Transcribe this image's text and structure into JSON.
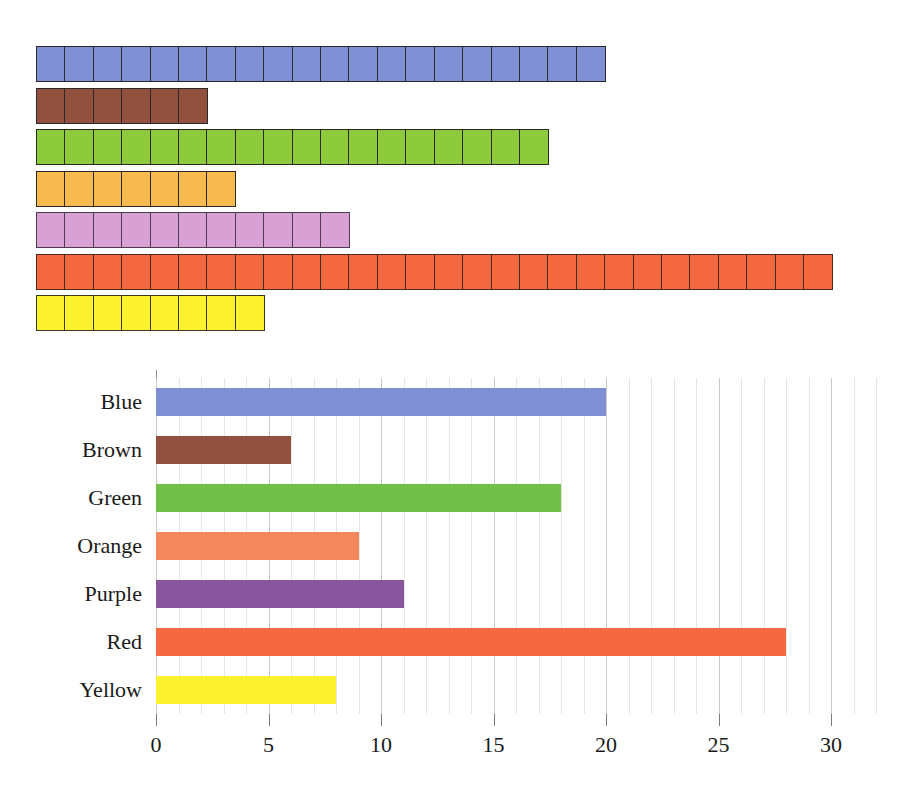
{
  "figure": {
    "title": "",
    "categories": [
      "Blue",
      "Brown",
      "Green",
      "Orange",
      "Purple",
      "Red",
      "Yellow"
    ]
  },
  "pictograph": {
    "name": "unit-square-pictograph",
    "unit_value": 1,
    "rows": [
      {
        "label": "Blue",
        "count": 20,
        "color": "#7f8fd4",
        "border": "#2a2a2a"
      },
      {
        "label": "Brown",
        "count": 6,
        "color": "#92503f",
        "border": "#2a2a2a"
      },
      {
        "label": "Green",
        "count": 18,
        "color": "#8ecb3c",
        "border": "#2a2a2a"
      },
      {
        "label": "Orange",
        "count": 7,
        "color": "#f7ba4e",
        "border": "#2a2a2a"
      },
      {
        "label": "Purple",
        "count": 11,
        "color": "#d9a0d4",
        "border": "#4a3a52"
      },
      {
        "label": "Red",
        "count": 28,
        "color": "#f4693f",
        "border": "#4a2a20"
      },
      {
        "label": "Yellow",
        "count": 8,
        "color": "#fbf12e",
        "border": "#3a3a1a"
      }
    ]
  },
  "chart_data": {
    "type": "bar",
    "orientation": "horizontal",
    "title": "",
    "subtitle": "",
    "xlabel": "",
    "ylabel": "",
    "categories": [
      "Blue",
      "Brown",
      "Green",
      "Orange",
      "Purple",
      "Red",
      "Yellow"
    ],
    "values": [
      20,
      6,
      18,
      9,
      11,
      28,
      8
    ],
    "colors": [
      "#7f8fd4",
      "#92503f",
      "#6fbf49",
      "#f4875b",
      "#8a579e",
      "#f4693f",
      "#fbf12e"
    ],
    "xlim": [
      0,
      32
    ],
    "xticks": [
      0,
      5,
      10,
      15,
      20,
      25,
      30
    ],
    "xtick_labels": [
      "0",
      "5",
      "10",
      "15",
      "20",
      "25",
      "30"
    ],
    "minor_tick_step": 1,
    "grid": true,
    "grid_axis": "x",
    "legend": false,
    "legend_position": "none",
    "axis_color": "#8d8d8d",
    "gridline_color": "#c9c9c9",
    "background": "#ffffff"
  }
}
